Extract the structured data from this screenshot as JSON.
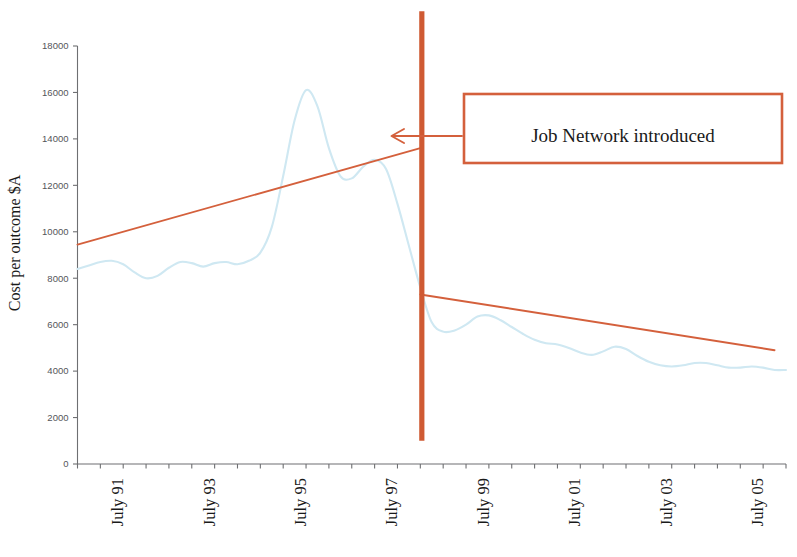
{
  "chart_data": {
    "type": "line",
    "title": "",
    "subtitle": "",
    "xlabel": "",
    "ylabel": "Cost per outcome $A",
    "ylim": [
      0,
      18000
    ],
    "ytick_values": [
      0,
      2000,
      4000,
      6000,
      8000,
      10000,
      12000,
      14000,
      16000,
      18000
    ],
    "ytick_labels": [
      "0",
      "2000",
      "4000",
      "6000",
      "8000",
      "10000",
      "12000",
      "14000",
      "16000",
      "18000"
    ],
    "xtick_labels": [
      "July 91",
      "July 93",
      "July 95",
      "July 97",
      "July 99",
      "July 01",
      "July 03",
      "July 05"
    ],
    "xlim": [
      "July 90",
      "July 06"
    ],
    "grid": false,
    "legend": "none",
    "series": [
      {
        "name": "Cost per outcome",
        "color": "#cfe8f2",
        "style": "smooth-line",
        "x": [
          "1990-07",
          "1990-10",
          "1991-01",
          "1991-04",
          "1991-07",
          "1991-10",
          "1992-01",
          "1992-04",
          "1992-07",
          "1992-10",
          "1993-01",
          "1993-04",
          "1993-07",
          "1993-10",
          "1994-01",
          "1994-04",
          "1994-07",
          "1994-10",
          "1995-01",
          "1995-04",
          "1995-07",
          "1995-10",
          "1996-01",
          "1996-04",
          "1996-07",
          "1996-10",
          "1997-01",
          "1997-04",
          "1997-07",
          "1997-10",
          "1998-01",
          "1998-04",
          "1998-07",
          "1998-10",
          "1999-01",
          "1999-04",
          "1999-07",
          "1999-10",
          "2000-01",
          "2000-04",
          "2000-07",
          "2000-10",
          "2001-01",
          "2001-04",
          "2001-07",
          "2001-10",
          "2002-01",
          "2002-04",
          "2002-07",
          "2002-10",
          "2003-01",
          "2003-04",
          "2003-07",
          "2003-10",
          "2004-01",
          "2004-04",
          "2004-07",
          "2004-10",
          "2005-01",
          "2005-04",
          "2005-07",
          "2005-10",
          "2006-01"
        ],
        "y": [
          8400,
          8550,
          8700,
          8750,
          8600,
          8250,
          8000,
          8100,
          8450,
          8700,
          8650,
          8500,
          8650,
          8700,
          8600,
          8750,
          9100,
          10200,
          12400,
          14800,
          16100,
          15400,
          13600,
          12400,
          12300,
          12800,
          13100,
          12700,
          11200,
          9400,
          7600,
          6100,
          5700,
          5750,
          6000,
          6350,
          6400,
          6200,
          5900,
          5600,
          5350,
          5200,
          5150,
          5000,
          4800,
          4700,
          4850,
          5050,
          4950,
          4650,
          4400,
          4250,
          4200,
          4250,
          4350,
          4350,
          4250,
          4150,
          4150,
          4200,
          4150,
          4050,
          4050
        ]
      }
    ],
    "trend_lines": [
      {
        "name": "pre-Job-Network trend",
        "color": "#d4603c",
        "x_start": "July 90",
        "y_start": 9450,
        "x_end": "Jan 1998",
        "y_end": 13600
      },
      {
        "name": "post-Job-Network trend",
        "color": "#d4603c",
        "x_start": "Jan 1998",
        "y_start": 7300,
        "x_end": "July 05",
        "y_end": 4900
      }
    ],
    "event_marker": {
      "name": "Job Network introduced",
      "color": "#cf5a33",
      "x": "Jan 1998",
      "y_top": 19500,
      "y_bottom": 1000
    },
    "annotations": [
      {
        "text": "Job Network introduced",
        "box_color": "#d4603c",
        "text_color": "#1a1a1a",
        "arrow": "left"
      }
    ]
  },
  "axis": {
    "y_title": "Cost per outcome $A"
  },
  "annotation": {
    "label": "Job Network introduced"
  }
}
